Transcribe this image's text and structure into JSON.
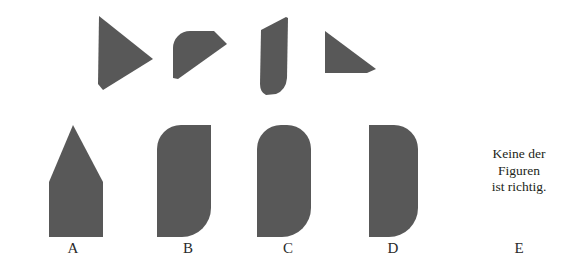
{
  "page": {
    "background_color": "#ffffff",
    "shape_fill_color": "#585858",
    "text_color": "#231f20",
    "kind": "non-verbal-reasoning-shape-assembly-item",
    "language": "de"
  },
  "pieces": {
    "caption": "",
    "items": [
      {
        "id": "piece-1",
        "name": "right-pointing-triangle",
        "x": 97,
        "y": 14,
        "width": 56,
        "height": 78
      },
      {
        "id": "piece-2",
        "name": "quarter-round-wedge",
        "x": 170,
        "y": 30,
        "width": 56,
        "height": 48
      },
      {
        "id": "piece-3",
        "name": "narrow-curved-slab",
        "x": 258,
        "y": 16,
        "width": 30,
        "height": 78
      },
      {
        "id": "piece-4",
        "name": "right-triangle-flat-left",
        "x": 323,
        "y": 30,
        "width": 52,
        "height": 48
      }
    ]
  },
  "options": {
    "items": [
      {
        "id": "option-a",
        "label": "A",
        "shape_name": "house-pentagon",
        "x": 18
      },
      {
        "id": "option-b",
        "label": "B",
        "shape_name": "rounded-top-left-bottom-right-rectangle",
        "x": 133
      },
      {
        "id": "option-c",
        "label": "C",
        "shape_name": "rounded-top-both-and-bottom-right-rectangle",
        "x": 233
      },
      {
        "id": "option-d",
        "label": "D",
        "shape_name": "rounded-right-side-rectangle",
        "x": 338
      }
    ],
    "option_e": {
      "id": "option-e",
      "label": "E",
      "lines": [
        "Keine der",
        "Figuren",
        "ist richtig."
      ]
    }
  }
}
